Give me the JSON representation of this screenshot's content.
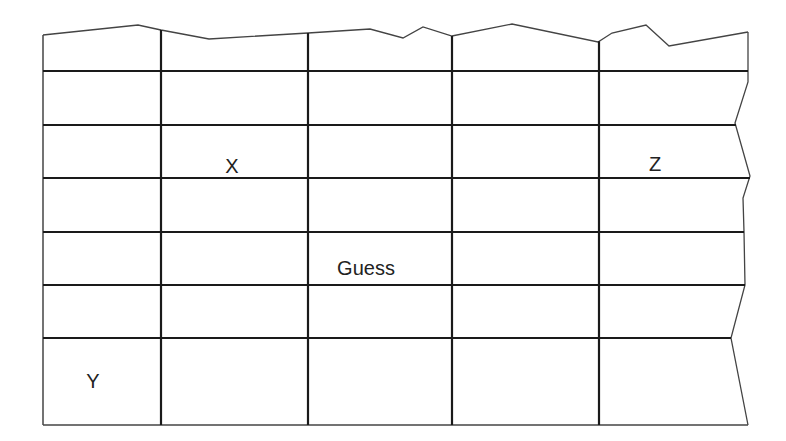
{
  "diagram": {
    "type": "torn-grid",
    "colors": {
      "line": "#1a1a1a",
      "outline": "#444444",
      "background": "#ffffff",
      "text": "#222222"
    },
    "columns_x": [
      43,
      161,
      308,
      452,
      599
    ],
    "rows_y": [
      71,
      125,
      178,
      232,
      285,
      338
    ],
    "right_edge_at_rows": [
      748,
      736,
      750,
      744,
      745,
      731
    ],
    "bottom_y": 425,
    "bottom_right_x": 748,
    "top_outline": [
      [
        43,
        35
      ],
      [
        138,
        25
      ],
      [
        161,
        30
      ],
      [
        209,
        39
      ],
      [
        308,
        33
      ],
      [
        370,
        29
      ],
      [
        403,
        38
      ],
      [
        423,
        27
      ],
      [
        452,
        36
      ],
      [
        512,
        24
      ],
      [
        598,
        42
      ],
      [
        612,
        33
      ],
      [
        646,
        25
      ],
      [
        669,
        46
      ],
      [
        748,
        32
      ]
    ],
    "right_outline": [
      [
        748,
        32
      ],
      [
        748,
        82
      ],
      [
        735,
        123
      ],
      [
        750,
        176
      ],
      [
        743,
        198
      ],
      [
        744,
        232
      ],
      [
        745,
        285
      ],
      [
        731,
        338
      ],
      [
        748,
        425
      ]
    ],
    "labels": [
      {
        "id": "x",
        "text": "X",
        "x": 232,
        "y": 166
      },
      {
        "id": "z",
        "text": "Z",
        "x": 655,
        "y": 164
      },
      {
        "id": "guess",
        "text": "Guess",
        "x": 366,
        "y": 268
      },
      {
        "id": "y",
        "text": "Y",
        "x": 93,
        "y": 381
      }
    ]
  }
}
